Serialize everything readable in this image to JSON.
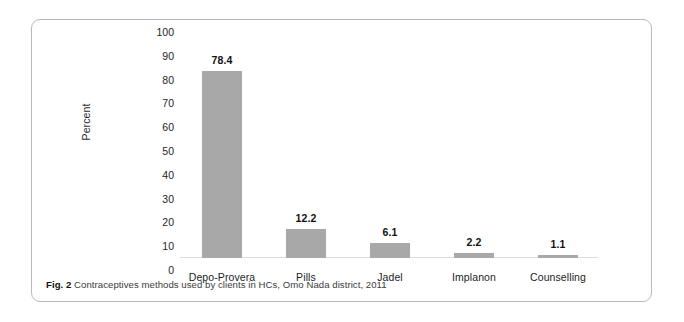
{
  "figure": {
    "caption_prefix": "Fig. 2",
    "caption_text": "Contraceptives methods used by clients in HCs, Omo Nada district, 2011"
  },
  "chart_data": {
    "type": "bar",
    "title": "",
    "xlabel": "",
    "ylabel": "Percent",
    "ylim": [
      0,
      100
    ],
    "yticks": [
      100,
      90,
      80,
      70,
      60,
      50,
      40,
      30,
      20,
      10,
      0
    ],
    "grid": false,
    "legend": false,
    "bar_color": "#a8a8a8",
    "categories": [
      "Depo-Provera",
      "Pills",
      "Jadel",
      "Implanon",
      "Counselling"
    ],
    "values": [
      78.4,
      12.2,
      6.1,
      2.2,
      1.1
    ],
    "value_labels": [
      "78.4",
      "12.2",
      "6.1",
      "2.2",
      "1.1"
    ]
  }
}
